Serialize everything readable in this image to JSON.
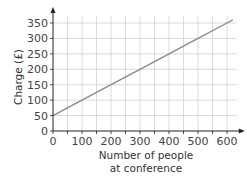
{
  "chart_data": {
    "type": "line",
    "title": "",
    "xlabel": "Number of people at conference",
    "xlabel_lines": [
      "Number of people",
      "at conference"
    ],
    "ylabel": "Charge (£)",
    "xlim": [
      0,
      620
    ],
    "ylim": [
      0,
      360
    ],
    "x_ticks": [
      0,
      100,
      200,
      300,
      400,
      500,
      600
    ],
    "y_ticks": [
      0,
      50,
      100,
      150,
      200,
      250,
      300,
      350
    ],
    "grid": true,
    "legend": null,
    "series": [
      {
        "name": "Charge",
        "x": [
          0,
          100,
          200,
          300,
          400,
          500,
          600,
          620
        ],
        "y": [
          50,
          100,
          150,
          200,
          250,
          300,
          350,
          360
        ],
        "color": "#8a8a8a"
      }
    ]
  },
  "colors": {
    "grid": "#d0d0d0",
    "axis": "#222222",
    "line": "#8a8a8a"
  }
}
